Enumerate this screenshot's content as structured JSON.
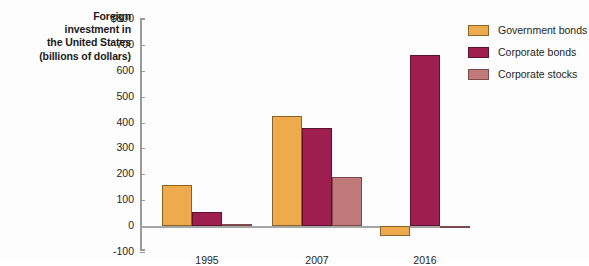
{
  "chart_data": {
    "type": "bar",
    "title": "Foreign investment in the United States (billions of dollars)",
    "title_lines": [
      "Foreign",
      "investment in",
      "the United States",
      "(billions of dollars)"
    ],
    "xlabel": "",
    "ylabel": "Foreign investment in the United States (billions of dollars)",
    "categories": [
      "1995",
      "2007",
      "2016"
    ],
    "series": [
      {
        "name": "Government bonds",
        "color": "#edab4e",
        "values": [
          160,
          425,
          -40
        ]
      },
      {
        "name": "Corporate bonds",
        "color": "#9e1f4f",
        "values": [
          55,
          380,
          660
        ]
      },
      {
        "name": "Corporate stocks",
        "color": "#c07a7c",
        "values": [
          10,
          190,
          -8
        ]
      }
    ],
    "ylim": [
      -100,
      800
    ],
    "ytick_values": [
      800,
      700,
      600,
      500,
      400,
      300,
      200,
      100,
      0,
      -100
    ],
    "ytick_labels": [
      "$800",
      "700",
      "600",
      "500",
      "400",
      "300",
      "200",
      "100",
      "0",
      "-100"
    ],
    "grid": false,
    "legend_position": "right"
  },
  "legend": {
    "items": [
      {
        "label": "Government bonds",
        "color": "#edab4e"
      },
      {
        "label": "Corporate bonds",
        "color": "#9e1f4f"
      },
      {
        "label": "Corporate stocks",
        "color": "#c07a7c"
      }
    ]
  }
}
